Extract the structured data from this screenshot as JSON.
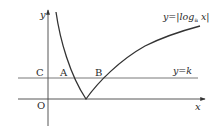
{
  "figure": {
    "function_label_prefix": "y=|log",
    "function_label_sub": "a",
    "function_label_suffix": " x|",
    "line_label": "y=k",
    "axis_x_label": "x",
    "axis_y_label": "y",
    "origin_label": "O",
    "points": {
      "C": "C",
      "A": "A",
      "B": "B"
    }
  }
}
